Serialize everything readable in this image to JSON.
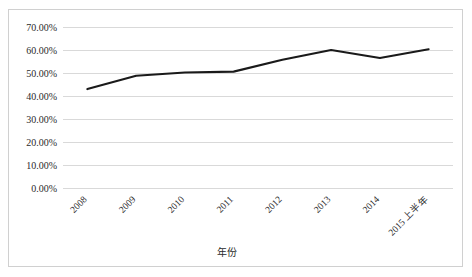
{
  "chart_data": {
    "type": "line",
    "title": "",
    "xlabel": "年份",
    "ylabel": "",
    "categories": [
      "2008",
      "2009",
      "2010",
      "2011",
      "2012",
      "2013",
      "2014",
      "2015 上半年"
    ],
    "values": [
      43.0,
      48.8,
      50.2,
      50.6,
      55.8,
      60.0,
      56.5,
      60.3
    ],
    "series": [
      {
        "name": "",
        "values": [
          43.0,
          48.8,
          50.2,
          50.6,
          55.8,
          60.0,
          56.5,
          60.3
        ]
      }
    ],
    "ytick_labels": [
      "70.00%",
      "60.00%",
      "50.00%",
      "40.00%",
      "30.00%",
      "20.00%",
      "10.00%",
      "0.00%"
    ],
    "ytick_values": [
      70,
      60,
      50,
      40,
      30,
      20,
      10,
      0
    ],
    "ylim": [
      0,
      70
    ],
    "grid": true,
    "legend": "none",
    "line_color": "#1a1a1a",
    "grid_color": "#d9d9d9",
    "border_color": "#d0d0d0",
    "background_color": "#ffffff",
    "xtick_rotation_deg": -45
  }
}
